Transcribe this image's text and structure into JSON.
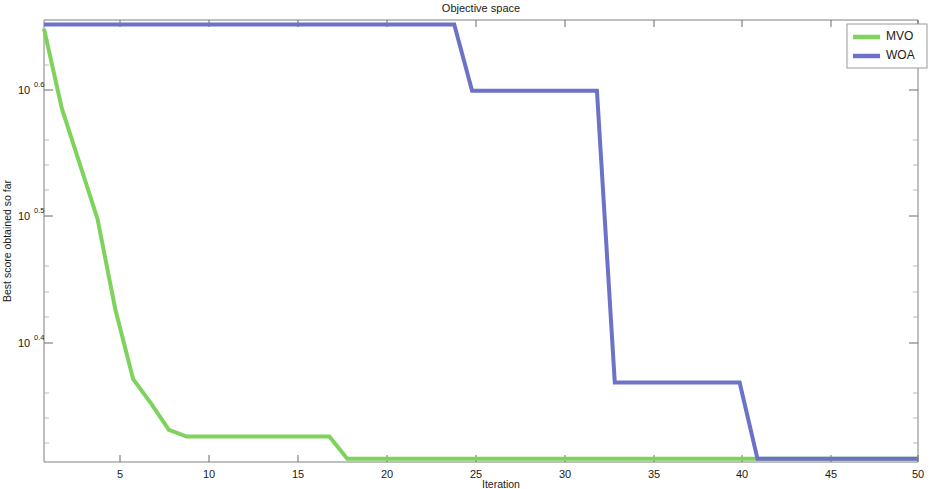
{
  "chart_data": {
    "type": "line",
    "title": "Objective space",
    "xlabel": "Iteration",
    "ylabel": "Best score obtained so far",
    "yscale": "log",
    "xlim": [
      1,
      50
    ],
    "ylim_log10": [
      0.28,
      0.68
    ],
    "grid": false,
    "legend_position": "top-right",
    "xticks": [
      5,
      10,
      15,
      20,
      25,
      30,
      35,
      40,
      45,
      50
    ],
    "xtick_labels": [
      "5",
      "10",
      "15",
      "20",
      "25",
      "30",
      "35",
      "40",
      "45",
      "50"
    ],
    "yticks_log10": [
      0.6,
      0.5,
      0.4
    ],
    "ytick_labels": [
      "10^0.6",
      "10^0.5",
      "10^0.4"
    ],
    "ytick_mantissa": [
      "10",
      "10",
      "10"
    ],
    "ytick_exponent": [
      "0.6",
      "0.5",
      "0.4"
    ],
    "series": [
      {
        "name": "MVO",
        "color": "#7ED35C",
        "linewidth": 4,
        "x": [
          1,
          2,
          3,
          4,
          5,
          6,
          7,
          8,
          9,
          10,
          11,
          12,
          13,
          14,
          15,
          16,
          17,
          18,
          19,
          20,
          25,
          30,
          35,
          40,
          45,
          50
        ],
        "y_log10": [
          0.672,
          0.6,
          0.55,
          0.5,
          0.418,
          0.355,
          0.333,
          0.309,
          0.303,
          0.303,
          0.303,
          0.303,
          0.303,
          0.303,
          0.303,
          0.303,
          0.303,
          0.283,
          0.283,
          0.283,
          0.283,
          0.283,
          0.283,
          0.283,
          0.283,
          0.283
        ]
      },
      {
        "name": "WOA",
        "color": "#6C72C8",
        "linewidth": 4,
        "x": [
          1,
          5,
          10,
          15,
          20,
          24,
          25,
          30,
          32,
          33,
          35,
          40,
          41,
          45,
          50
        ],
        "y_log10": [
          0.676,
          0.676,
          0.676,
          0.676,
          0.676,
          0.676,
          0.616,
          0.616,
          0.616,
          0.352,
          0.352,
          0.352,
          0.283,
          0.283,
          0.283
        ]
      }
    ]
  },
  "legend": {
    "entries": [
      {
        "label": "MVO",
        "color": "#7ED35C"
      },
      {
        "label": "WOA",
        "color": "#6C72C8"
      }
    ]
  }
}
